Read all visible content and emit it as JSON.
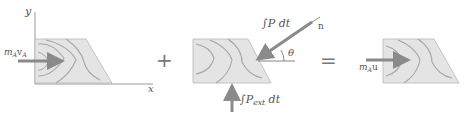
{
  "diagram": {
    "type": "impulse-momentum diagram",
    "panels": [
      {
        "id": "initial-momentum",
        "axes": {
          "x_label": "x",
          "y_label": "y"
        },
        "arrow_label_main": "m",
        "arrow_label_sub": "A",
        "arrow_label_v": "v",
        "arrow_label_v_sub": "A"
      },
      {
        "id": "impulses",
        "impulse_P_label": "∫P dt",
        "impulse_Pext_label_prefix": "∫P",
        "impulse_Pext_sub": "ext",
        "impulse_Pext_suffix": " dt",
        "normal_label": "n",
        "angle_label": "θ"
      },
      {
        "id": "final-momentum",
        "arrow_label_main": "m",
        "arrow_label_sub": "A",
        "arrow_label_u": "u"
      }
    ],
    "operators": {
      "plus": "+",
      "equals": "="
    },
    "colors": {
      "body_fill": "#e4e4e4",
      "body_edge": "#b0b0b0",
      "grain": "#a6a6a6",
      "arrow": "#8a8a8a",
      "axis": "#9a9a9a",
      "text": "#555555"
    }
  }
}
